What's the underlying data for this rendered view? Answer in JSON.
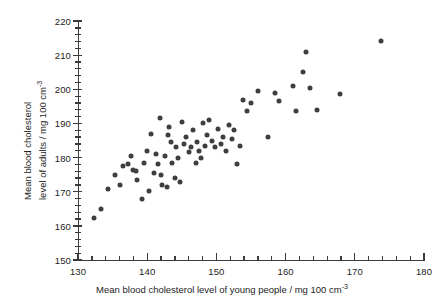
{
  "chart_data": {
    "type": "scatter",
    "title": "",
    "xlabel": "Mean blood cholesterol level of young people / mg 100 cm-3",
    "ylabel": "Mean blood cholesterol level of adults / mg 100 cm-3",
    "xlabel_parts": {
      "main": "Mean blood cholesterol level of young people / mg 100 cm",
      "exponent": "-3"
    },
    "ylabel_lines": [
      "Mean blood cholesterol",
      "level of adults / mg 100 cm"
    ],
    "ylabel_exponent": "-3",
    "xlim": [
      130,
      180
    ],
    "ylim": [
      150,
      220
    ],
    "x_major_step": 10,
    "x_minor_step": 2,
    "y_major_step": 10,
    "y_minor_step": 2,
    "xticks": [
      130,
      140,
      150,
      160,
      170,
      180
    ],
    "yticks": [
      150,
      160,
      170,
      180,
      190,
      200,
      210,
      220
    ],
    "grid": false,
    "legend": null,
    "marker_color": "#3d3d42",
    "axis_color": "#3a3a3a",
    "points": [
      [
        132.3,
        162.3
      ],
      [
        133.3,
        165.0
      ],
      [
        134.4,
        170.8
      ],
      [
        135.4,
        175.0
      ],
      [
        136.0,
        172.0
      ],
      [
        136.5,
        177.5
      ],
      [
        137.2,
        178.0
      ],
      [
        137.6,
        180.5
      ],
      [
        138.0,
        176.5
      ],
      [
        138.4,
        176.2
      ],
      [
        138.5,
        173.5
      ],
      [
        139.3,
        167.8
      ],
      [
        139.6,
        178.5
      ],
      [
        140.0,
        182.0
      ],
      [
        140.3,
        170.2
      ],
      [
        140.6,
        187.0
      ],
      [
        141.0,
        175.5
      ],
      [
        141.3,
        181.0
      ],
      [
        141.6,
        178.0
      ],
      [
        141.9,
        191.5
      ],
      [
        142.0,
        175.0
      ],
      [
        142.2,
        172.0
      ],
      [
        142.5,
        180.5
      ],
      [
        142.8,
        171.5
      ],
      [
        143.0,
        186.5
      ],
      [
        143.2,
        189.0
      ],
      [
        143.5,
        184.5
      ],
      [
        143.6,
        178.5
      ],
      [
        144.0,
        174.0
      ],
      [
        144.2,
        183.0
      ],
      [
        144.4,
        180.0
      ],
      [
        144.8,
        172.8
      ],
      [
        145.0,
        190.5
      ],
      [
        145.3,
        184.0
      ],
      [
        145.6,
        186.0
      ],
      [
        146.0,
        181.5
      ],
      [
        146.3,
        183.0
      ],
      [
        146.6,
        188.0
      ],
      [
        147.0,
        178.5
      ],
      [
        147.2,
        184.5
      ],
      [
        147.5,
        182.0
      ],
      [
        147.8,
        180.0
      ],
      [
        148.0,
        190.0
      ],
      [
        148.3,
        183.5
      ],
      [
        148.6,
        186.5
      ],
      [
        149.0,
        191.0
      ],
      [
        149.4,
        185.0
      ],
      [
        149.8,
        183.0
      ],
      [
        150.2,
        188.5
      ],
      [
        150.6,
        184.0
      ],
      [
        151.0,
        186.0
      ],
      [
        151.4,
        182.0
      ],
      [
        151.8,
        189.5
      ],
      [
        152.2,
        185.5
      ],
      [
        152.6,
        188.0
      ],
      [
        153.0,
        178.0
      ],
      [
        153.4,
        183.5
      ],
      [
        153.8,
        197.0
      ],
      [
        154.4,
        193.5
      ],
      [
        155.0,
        196.0
      ],
      [
        156.0,
        199.5
      ],
      [
        157.5,
        186.0
      ],
      [
        158.5,
        199.0
      ],
      [
        159.0,
        196.5
      ],
      [
        161.0,
        201.0
      ],
      [
        161.5,
        193.5
      ],
      [
        162.5,
        205.0
      ],
      [
        163.0,
        211.0
      ],
      [
        163.5,
        200.5
      ],
      [
        164.5,
        194.0
      ],
      [
        167.8,
        198.5
      ],
      [
        173.8,
        214.0
      ]
    ]
  }
}
